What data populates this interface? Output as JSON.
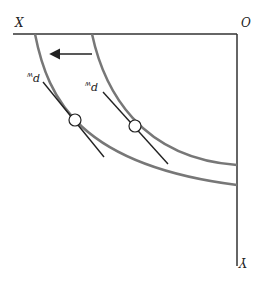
{
  "diagram": {
    "title": "",
    "axes": {
      "origin_label": "O",
      "horizontal_label": "X",
      "vertical_label": "Y",
      "color": "#333333"
    },
    "curves": {
      "color": "#777777",
      "inner": {
        "name": "initial-curve"
      },
      "outer": {
        "name": "shifted-curve"
      }
    },
    "tangents": [
      {
        "label": "p_w",
        "label_display": "p",
        "label_sub": "w"
      },
      {
        "label": "p_w",
        "label_display": "p",
        "label_sub": "w"
      }
    ],
    "shift_arrow": {
      "direction": "toward X"
    },
    "orientation_note": "figure rendered rotated 180 degrees"
  }
}
